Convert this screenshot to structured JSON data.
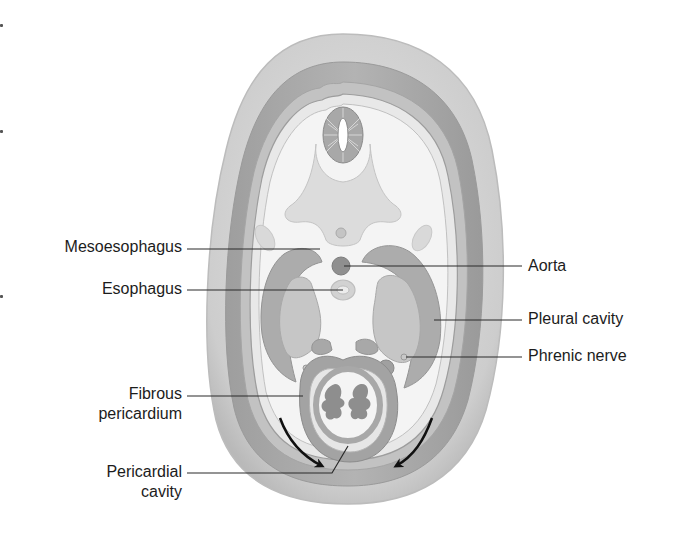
{
  "figure": {
    "colors": {
      "outer_wall": "#cfcfcf",
      "body_wall_dark": "#a9a9a9",
      "cavity_fill": "#f2f2f2",
      "organ_mid": "#bdbdbd",
      "organ_dark": "#8f8f8f",
      "leader_line": "#2a2a2a",
      "arrow": "#111111",
      "text": "#1c1c1c"
    }
  },
  "labels": {
    "left": [
      {
        "id": "mesoesophagus",
        "lines": [
          "Mesoesophagus"
        ]
      },
      {
        "id": "esophagus",
        "lines": [
          "Esophagus"
        ]
      },
      {
        "id": "fibrous_pericardium",
        "lines": [
          "Fibrous",
          "pericardium"
        ]
      },
      {
        "id": "pericardial_cavity",
        "lines": [
          "Pericardial",
          "cavity"
        ]
      }
    ],
    "right": [
      {
        "id": "aorta",
        "lines": [
          "Aorta"
        ]
      },
      {
        "id": "pleural_cavity",
        "lines": [
          "Pleural cavity"
        ]
      },
      {
        "id": "phrenic_nerve",
        "lines": [
          "Phrenic nerve"
        ]
      }
    ]
  }
}
